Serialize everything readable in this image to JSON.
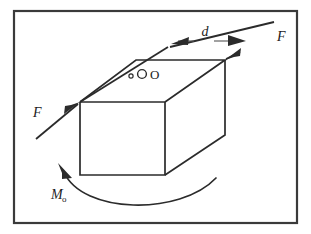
{
  "figure": {
    "kind": "free-body-diagram",
    "background_color": "#ffffff",
    "line_color": "#2b2b2b",
    "frame_color": "#3a3a3a",
    "dimension_color": "#555555"
  },
  "labels": {
    "force_left": "F",
    "force_right": "F",
    "distance": "d",
    "moment": "M",
    "moment_subscript": "o",
    "point": "O"
  },
  "elements": {
    "frame": "figure-border",
    "solid": "rectangular-block",
    "upper_force_arrow": "force-arrow-upper-right",
    "lower_force_arrow": "force-arrow-lower-left",
    "dimension": "distance-dimension-d",
    "moment_arc": "moment-arc-arrow",
    "point_marker": "point-o-marker"
  },
  "geometry": {
    "frame": {
      "x": 13,
      "y": 10,
      "width": 285,
      "height": 214
    },
    "block": {
      "front_top_left": [
        80,
        102
      ],
      "front_top_right": [
        165,
        102
      ],
      "front_bottom_left": [
        80,
        175
      ],
      "front_bottom_right": [
        165,
        175
      ],
      "back_top_left": [
        136,
        60
      ],
      "back_top_right": [
        225,
        60
      ],
      "back_bottom_right": [
        225,
        135
      ]
    },
    "force_line_upper": {
      "from": [
        168,
        47
      ],
      "to": [
        274,
        22
      ]
    },
    "force_line_lower": {
      "from": [
        36,
        138
      ],
      "to": [
        100,
        88
      ]
    },
    "dimension_line": {
      "from": [
        172,
        42
      ],
      "to": [
        244,
        42
      ]
    },
    "moment_arc": {
      "start": [
        62,
        171
      ],
      "end": [
        213,
        180
      ],
      "apex_y": 213
    }
  }
}
